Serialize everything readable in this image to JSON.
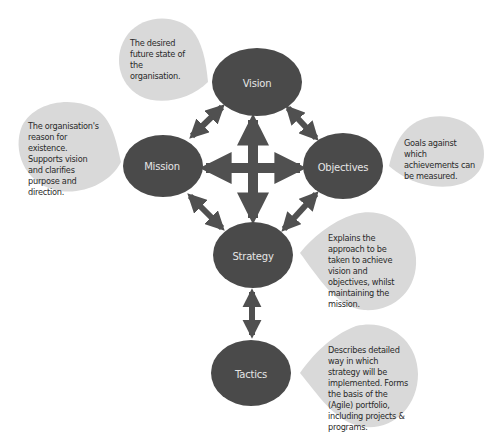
{
  "colors": {
    "node_fill": "#4a4a4a",
    "arrow_fill": "#505050",
    "callout_fill": "#d9d9d9",
    "node_text": "#e6e6e6",
    "callout_text": "#2a2a2a",
    "background": "#ffffff"
  },
  "nodes": {
    "vision": {
      "label": "Vision"
    },
    "mission": {
      "label": "Mission"
    },
    "objectives": {
      "label": "Objectives"
    },
    "strategy": {
      "label": "Strategy"
    },
    "tactics": {
      "label": "Tactics"
    }
  },
  "callouts": {
    "vision": {
      "text": "The desired future state of the organisation."
    },
    "mission": {
      "text": "The organisation's reason for existence. Supports vision and clarifies purpose and direction."
    },
    "objectives": {
      "text": "Goals against which achievements can be measured."
    },
    "strategy": {
      "text": "Explains the approach to be taken to achieve vision and objectives, whilst maintaining the mission."
    },
    "tactics": {
      "text": "Describes detailed way in which strategy will be implemented. Forms the basis of the (Agile) portfolio, including projects & programs."
    }
  },
  "connections": [
    {
      "from": "Vision",
      "to": "Mission",
      "type": "bidirectional"
    },
    {
      "from": "Vision",
      "to": "Objectives",
      "type": "bidirectional"
    },
    {
      "from": "Mission",
      "to": "Strategy",
      "type": "bidirectional"
    },
    {
      "from": "Objectives",
      "to": "Strategy",
      "type": "bidirectional"
    },
    {
      "from": "Strategy",
      "to": "Tactics",
      "type": "bidirectional"
    },
    {
      "from": "Center",
      "to": [
        "Vision",
        "Mission",
        "Objectives",
        "Strategy"
      ],
      "type": "four-way-cross"
    }
  ]
}
